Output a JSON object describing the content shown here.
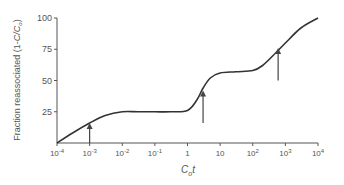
{
  "chart_data": {
    "type": "line",
    "title": "",
    "xlabel": "C0t",
    "xlabel_main": "C",
    "xlabel_sub": "o",
    "xlabel_tail": "t",
    "ylabel": "Fraction reassociated (1-C/C0)",
    "x_scale": "log",
    "xlim": [
      0.0001,
      10000
    ],
    "ylim": [
      0,
      100
    ],
    "grid": false,
    "legend": null,
    "x_ticks": [
      {
        "value": 0.0001,
        "base": "10",
        "exp": "-4"
      },
      {
        "value": 0.001,
        "base": "10",
        "exp": "-3"
      },
      {
        "value": 0.01,
        "base": "10",
        "exp": "-2"
      },
      {
        "value": 0.1,
        "base": "10",
        "exp": "-1"
      },
      {
        "value": 1,
        "base": "1",
        "exp": ""
      },
      {
        "value": 10,
        "base": "10",
        "exp": ""
      },
      {
        "value": 100,
        "base": "10",
        "exp": "2"
      },
      {
        "value": 1000,
        "base": "10",
        "exp": "3"
      },
      {
        "value": 10000,
        "base": "10",
        "exp": "4"
      }
    ],
    "y_ticks": [
      25,
      50,
      75,
      100
    ],
    "series": [
      {
        "name": "Reassociation curve",
        "x": [
          0.0001,
          0.0003,
          0.001,
          0.003,
          0.01,
          0.03,
          0.1,
          0.3,
          1,
          2,
          3,
          5,
          10,
          30,
          100,
          200,
          500,
          1000,
          3000,
          10000
        ],
        "y": [
          0,
          8,
          16,
          22,
          25,
          25,
          25,
          25,
          26,
          35,
          44,
          52,
          56,
          57,
          58,
          62,
          72,
          80,
          92,
          100
        ]
      }
    ],
    "annotations": [
      {
        "type": "arrow",
        "x": 0.001,
        "y_tail": 0,
        "y_head": 16,
        "label": ""
      },
      {
        "type": "arrow",
        "x": 3,
        "y_tail": 16,
        "y_head": 42,
        "label": ""
      },
      {
        "type": "arrow",
        "x": 600,
        "y_tail": 50,
        "y_head": 76,
        "label": ""
      }
    ]
  },
  "style": {
    "line_color": "#333333",
    "axis_color": "#555555",
    "text_color": "#555555"
  }
}
